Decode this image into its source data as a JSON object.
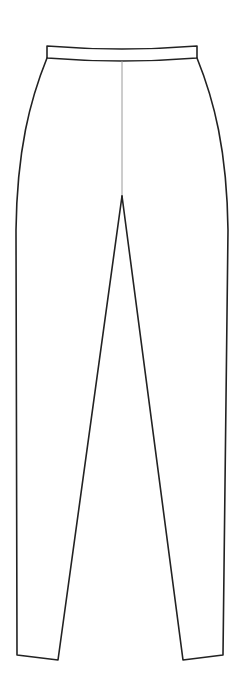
{
  "drawing": {
    "subject": "Technical flat sketch of fitted pants / leggings (front view)",
    "colors": {
      "background": "#ffffff",
      "outline": "#222222",
      "center_seam": "#9a9a9a"
    },
    "parts": {
      "waistband": "Waistband",
      "center_front_seam": "Center front seam",
      "left_leg": "Left leg",
      "right_leg": "Right leg",
      "left_hem": "Left hem",
      "right_hem": "Right hem"
    }
  }
}
